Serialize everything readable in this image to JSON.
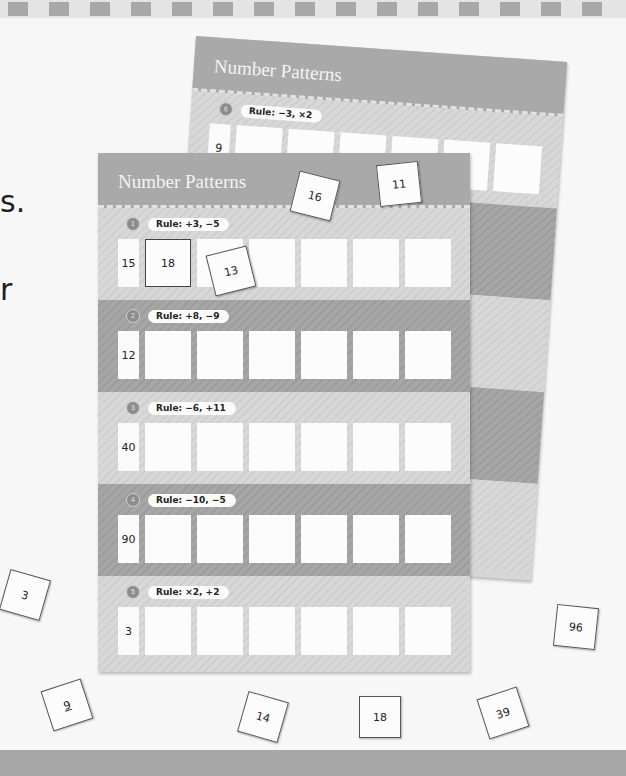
{
  "page": {
    "side_text": [
      "s.",
      "r"
    ]
  },
  "back_sheet": {
    "title": "Number Patterns",
    "problem": {
      "number": "6",
      "rule": "Rule: −3, ×2",
      "start": "9"
    }
  },
  "front_sheet": {
    "title": "Number Patterns",
    "problems": [
      {
        "number": "1",
        "rule": "Rule: +3, −5",
        "start": "15",
        "answers": [
          "18",
          "",
          "",
          "",
          "",
          ""
        ],
        "shade": "light"
      },
      {
        "number": "2",
        "rule": "Rule: +8, −9",
        "start": "12",
        "answers": [
          "",
          "",
          "",
          "",
          "",
          ""
        ],
        "shade": "dark"
      },
      {
        "number": "3",
        "rule": "Rule: −6, +11",
        "start": "40",
        "answers": [
          "",
          "",
          "",
          "",
          "",
          ""
        ],
        "shade": "light"
      },
      {
        "number": "4",
        "rule": "Rule: −10, −5",
        "start": "90",
        "answers": [
          "",
          "",
          "",
          "",
          "",
          ""
        ],
        "shade": "dark"
      },
      {
        "number": "5",
        "rule": "Rule: ×2, +2",
        "start": "3",
        "answers": [
          "",
          "",
          "",
          "",
          "",
          ""
        ],
        "shade": "light"
      }
    ]
  },
  "loose_tiles": [
    {
      "value": "16",
      "x": 294,
      "y": 175,
      "rotate": 14
    },
    {
      "value": "11",
      "x": 378,
      "y": 163,
      "rotate": -6
    },
    {
      "value": "13",
      "x": 210,
      "y": 250,
      "rotate": -14
    },
    {
      "value": "3",
      "x": 4,
      "y": 574,
      "rotate": 16
    },
    {
      "value": "96",
      "x": 555,
      "y": 606,
      "rotate": 6
    },
    {
      "value": "9",
      "x": 46,
      "y": 684,
      "rotate": -18
    },
    {
      "value": "14",
      "x": 242,
      "y": 696,
      "rotate": 16
    },
    {
      "value": "18",
      "x": 359,
      "y": 696,
      "rotate": 0
    },
    {
      "value": "39",
      "x": 482,
      "y": 692,
      "rotate": -18
    }
  ]
}
